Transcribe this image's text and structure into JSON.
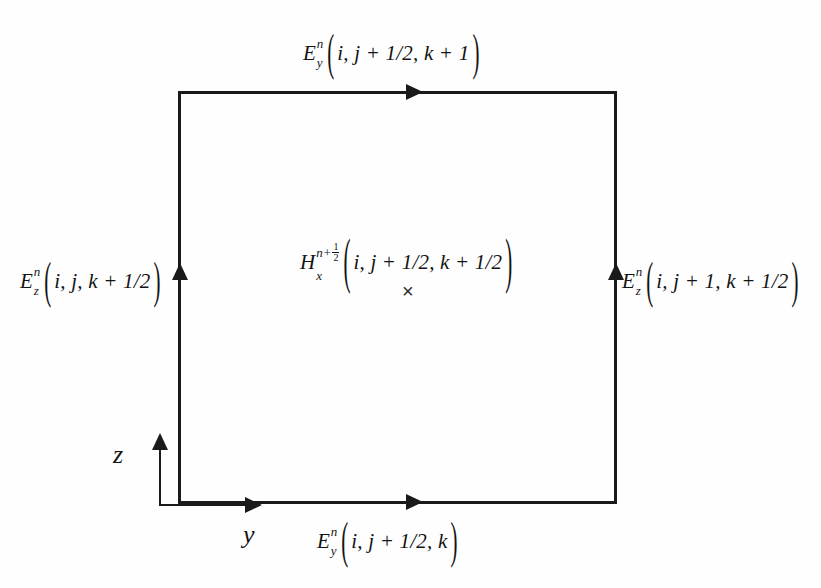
{
  "diagram": {
    "background_color": "#fefefe",
    "line_color": "#1a1a1a"
  },
  "labels": {
    "top": {
      "field": "E",
      "subscript": "y",
      "superscript": "n",
      "args": "i, j + 1/2, k + 1",
      "open_paren": "(",
      "close_paren": ")"
    },
    "bottom": {
      "field": "E",
      "subscript": "y",
      "superscript": "n",
      "args": "i, j + 1/2, k",
      "open_paren": "(",
      "close_paren": ")"
    },
    "left": {
      "field": "E",
      "subscript": "z",
      "superscript": "n",
      "args": "i, j, k + 1/2",
      "open_paren": "(",
      "close_paren": ")"
    },
    "right": {
      "field": "E",
      "subscript": "z",
      "superscript": "n",
      "args": "i, j + 1, k + 1/2",
      "open_paren": "(",
      "close_paren": ")"
    },
    "center": {
      "field": "H",
      "subscript": "x",
      "superscript_base": "n+",
      "superscript_frac_num": "1",
      "superscript_frac_den": "2",
      "args": "i, j + 1/2, k + 1/2",
      "open_paren": "(",
      "close_paren": ")",
      "marker": "×"
    }
  },
  "axes": {
    "vertical_label": "z",
    "horizontal_label": "y"
  }
}
